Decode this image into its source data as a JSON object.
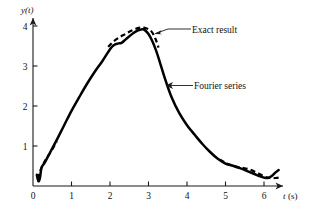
{
  "chart_data": {
    "type": "line",
    "title": "",
    "xlabel": "t (s)",
    "ylabel": "y(t)",
    "xlim": [
      0,
      6.6
    ],
    "ylim": [
      0,
      4.35
    ],
    "xticks": [
      0,
      1,
      2,
      3,
      4,
      5,
      6
    ],
    "xticklabels": [
      "0",
      "1",
      "2",
      "3",
      "4",
      "5",
      "6"
    ],
    "yticks": [
      1,
      2,
      3,
      4
    ],
    "yticklabels": [
      "1",
      "2",
      "3",
      "4"
    ],
    "grid": false,
    "legend_position": "inline-annotations",
    "annotations": [
      {
        "text": "Exact result",
        "style": "dashed",
        "x": 195,
        "y": 32
      },
      {
        "text": "Fourier series",
        "style": "solid",
        "x": 197,
        "y": 88
      }
    ],
    "series": [
      {
        "name": "Fourier series",
        "style": "solid",
        "x": [
          0.1,
          0.14,
          0.18,
          0.22,
          0.3,
          0.45,
          0.6,
          0.8,
          1.0,
          1.2,
          1.4,
          1.6,
          1.8,
          2.0,
          2.1,
          2.2,
          2.3,
          2.4,
          2.5,
          2.6,
          2.7,
          2.8,
          2.85,
          2.9,
          3.0,
          3.1,
          3.2,
          3.3,
          3.45,
          3.6,
          3.8,
          4.0,
          4.2,
          4.4,
          4.6,
          4.8,
          5.0,
          5.15,
          5.3,
          5.45,
          5.6,
          5.75,
          5.9,
          6.0,
          6.1,
          6.2,
          6.3,
          6.38
        ],
        "y": [
          0.28,
          0.12,
          0.2,
          0.45,
          0.58,
          0.85,
          1.12,
          1.5,
          1.88,
          2.22,
          2.55,
          2.85,
          3.12,
          3.42,
          3.52,
          3.56,
          3.58,
          3.66,
          3.74,
          3.82,
          3.88,
          3.91,
          3.92,
          3.9,
          3.8,
          3.62,
          3.38,
          3.08,
          2.62,
          2.22,
          1.82,
          1.52,
          1.28,
          1.05,
          0.85,
          0.68,
          0.56,
          0.52,
          0.47,
          0.42,
          0.36,
          0.3,
          0.24,
          0.21,
          0.2,
          0.25,
          0.34,
          0.4
        ]
      },
      {
        "name": "Exact result",
        "style": "dashed",
        "segments": [
          {
            "x": [
              0.12,
              0.18,
              0.26,
              0.36,
              0.48,
              0.62
            ],
            "y": [
              0.18,
              0.36,
              0.54,
              0.7,
              0.88,
              1.12
            ]
          },
          {
            "x": [
              1.95,
              2.1,
              2.25,
              2.4,
              2.55,
              2.7,
              2.82,
              2.95,
              3.08,
              3.18,
              3.26
            ],
            "y": [
              3.48,
              3.62,
              3.72,
              3.8,
              3.88,
              3.94,
              3.96,
              3.94,
              3.86,
              3.68,
              3.46
            ]
          },
          {
            "x": [
              4.85,
              5.0,
              5.2,
              5.4,
              5.6,
              5.8,
              6.0,
              6.15,
              6.3,
              6.4
            ],
            "y": [
              0.66,
              0.58,
              0.5,
              0.46,
              0.42,
              0.34,
              0.24,
              0.2,
              0.2,
              0.21
            ]
          }
        ]
      }
    ]
  },
  "figure": {
    "y_axis_label": "y(t)",
    "x_axis_label_symbol": "t",
    "x_axis_label_unit": "(s)",
    "exact_result_label": "Exact result",
    "fourier_series_label": "Fourier series"
  }
}
